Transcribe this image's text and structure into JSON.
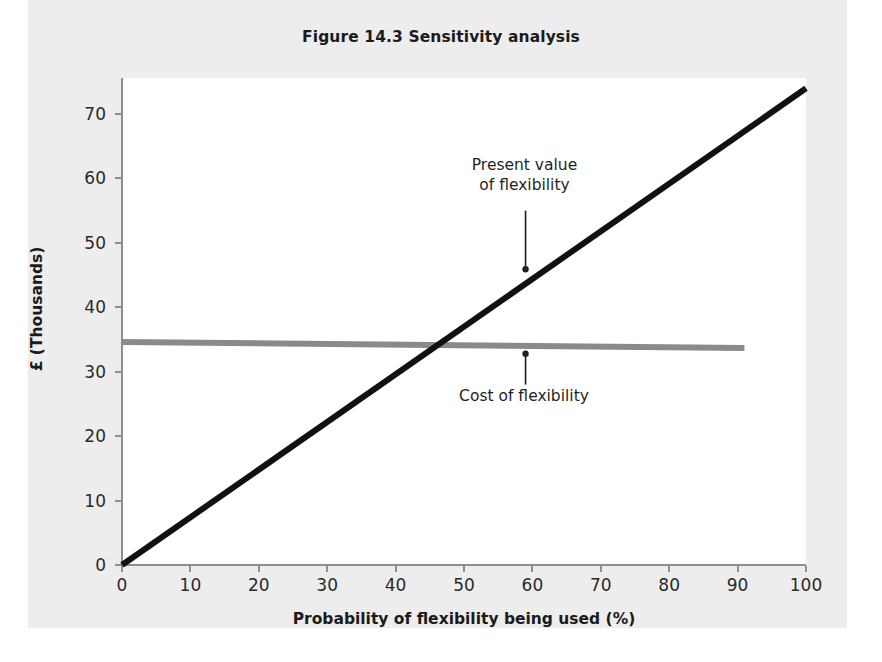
{
  "figure": {
    "title": "Figure 14.3 Sensitivity analysis"
  },
  "chart_data": {
    "type": "line",
    "title": "Figure 14.3 Sensitivity analysis",
    "xlabel": "Probability of flexibility being used (%)",
    "ylabel": "£ (Thousands)",
    "xlim": [
      0,
      100
    ],
    "ylim": [
      0,
      75.6
    ],
    "xticks": [
      "0",
      "10",
      "20",
      "30",
      "40",
      "50",
      "60",
      "70",
      "80",
      "90",
      "100"
    ],
    "xtick_values": [
      0,
      10,
      20,
      30,
      40,
      50,
      60,
      70,
      80,
      90,
      100
    ],
    "yticks": [
      "0",
      "10",
      "20",
      "30",
      "40",
      "50",
      "60",
      "70"
    ],
    "ytick_values": [
      0,
      10,
      20,
      30,
      40,
      50,
      60,
      70
    ],
    "grid": false,
    "legend": "annotations",
    "series": [
      {
        "name": "Present value of flexibility",
        "color": "#111111",
        "width": 6,
        "x": [
          0,
          100
        ],
        "y": [
          0,
          74.0
        ]
      },
      {
        "name": "Cost of flexibility",
        "color": "#8a8a8a",
        "width": 6,
        "x": [
          0,
          91
        ],
        "y": [
          34.6,
          33.7
        ]
      }
    ],
    "intersection": {
      "x": 46,
      "y": 34.1
    },
    "annotations": [
      {
        "name": "present-value-annotation",
        "line1": "Present value",
        "line2": "of flexibility",
        "leader_from": {
          "x": 59,
          "y": 55.0
        },
        "leader_to": {
          "x": 59,
          "y": 45.9
        }
      },
      {
        "name": "cost-annotation",
        "line1": "Cost of flexibility",
        "line2": "",
        "leader_from": {
          "x": 59,
          "y": 28.0
        },
        "leader_to": {
          "x": 59,
          "y": 32.8
        }
      }
    ]
  }
}
